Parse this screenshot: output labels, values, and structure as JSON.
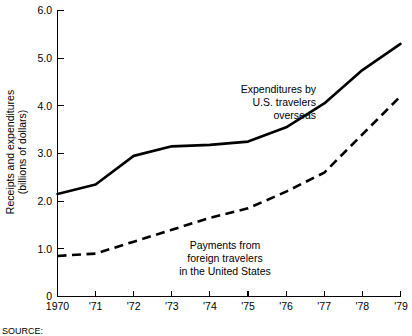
{
  "chart_data": {
    "type": "line",
    "title": "",
    "xlabel": "",
    "ylabel": "Receipts and expenditures (billions of dollars)",
    "ylabel_line1": "Receipts and expenditures",
    "ylabel_line2": "(billions of dollars)",
    "x": [
      1970,
      1971,
      1972,
      1973,
      1974,
      1975,
      1976,
      1977,
      1978,
      1979
    ],
    "categories": [
      "1970",
      "'71",
      "'72",
      "'73",
      "'74",
      "'75",
      "'76",
      "'77",
      "'78",
      "'79"
    ],
    "xtick_labels": [
      "1970",
      "'71",
      "'72",
      "'73",
      "'74",
      "'75",
      "'76",
      "'77",
      "'78",
      "'79"
    ],
    "ytick_labels": [
      "0",
      "1.0",
      "2.0",
      "3.0",
      "4.0",
      "5.0",
      "6.0"
    ],
    "ytick_values": [
      0,
      1.0,
      2.0,
      3.0,
      4.0,
      5.0,
      6.0
    ],
    "ylim": [
      0,
      6.0
    ],
    "xlim": [
      1970,
      1979
    ],
    "grid": false,
    "legend": "annotations",
    "series": [
      {
        "name": "Expenditures by U.S. travelers overseas",
        "style": "solid",
        "color": "#000000",
        "values": [
          2.15,
          2.35,
          2.95,
          3.15,
          3.18,
          3.25,
          3.55,
          4.05,
          4.75,
          5.3
        ]
      },
      {
        "name": "Payments from foreign travelers in the United States",
        "style": "dashed",
        "color": "#000000",
        "values": [
          0.85,
          0.9,
          1.15,
          1.4,
          1.65,
          1.85,
          2.2,
          2.6,
          3.4,
          4.2
        ]
      }
    ],
    "annotations": [
      {
        "id": "expenditures",
        "align": "end",
        "lines": [
          "Expenditures by",
          "U.S. travelers",
          "overseas"
        ],
        "line1": "Expenditures by",
        "line2": "U.S. travelers",
        "line3": "overseas"
      },
      {
        "id": "payments",
        "align": "middle",
        "lines": [
          "Payments from",
          "foreign travelers",
          "in the United States"
        ],
        "line1": "Payments from",
        "line2": "foreign travelers",
        "line3": "in the United States"
      }
    ],
    "source_note": "SOURCE:"
  }
}
